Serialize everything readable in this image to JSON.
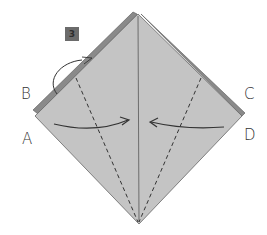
{
  "diagram": {
    "step_number": "3",
    "labels": {
      "a": "A",
      "b": "B",
      "c": "C",
      "d": "D"
    },
    "colors": {
      "paper": "#c4c4c4",
      "edge": "#808080",
      "line": "#333333",
      "badge": "#6b6b6b"
    }
  }
}
